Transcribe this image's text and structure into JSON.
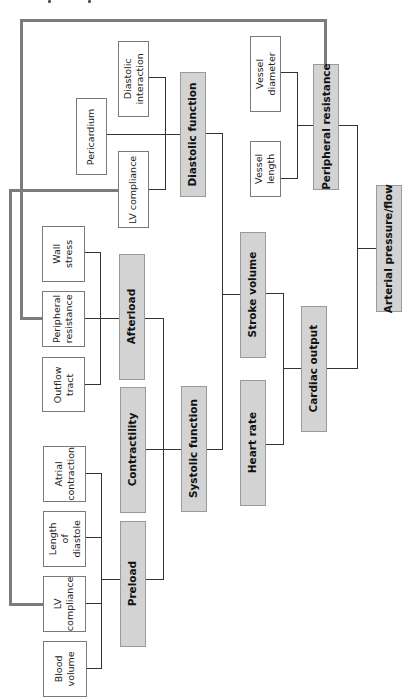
{
  "diagram": {
    "type": "hierarchical-tree",
    "orientation": "rotated-90-ccw",
    "colors": {
      "plain_box_fill": "#ffffff",
      "shaded_box_fill": "#d3d3d3",
      "connector": "#333333",
      "feedback_loop": "#7c7c7c"
    },
    "nodes": {
      "arterial_pressure_flow": "Arterial pressure/flow",
      "cardiac_output": "Cardiac output",
      "peripheral_resistance_main": "Peripheral resistance",
      "stroke_volume": "Stroke volume",
      "heart_rate": "Heart rate",
      "diastolic_function": "Diastolic function",
      "systolic_function": "Systolic function",
      "afterload": "Afterload",
      "contractility": "Contractility",
      "preload": "Preload",
      "vessel_diameter": "Vessel\ndiameter",
      "vessel_length": "Vessel\nlength",
      "diastolic_interaction": "Diastolic\ninteraction",
      "pericardium": "Pericardium",
      "lv_compliance_top": "LV compliance",
      "wall_stress": "Wall\nstress",
      "peripheral_resistance_afterload": "Peripheral\nresistance",
      "outflow_tract": "Outflow\ntract",
      "atrial_contraction": "Atrial\ncontraction",
      "length_of_diastole": "Length\nof\ndiastole",
      "lv_compliance_bottom": "LV\ncompliance",
      "blood_volume": "Blood\nvolume"
    },
    "edges": [
      [
        "cardiac_output",
        "arterial_pressure_flow"
      ],
      [
        "peripheral_resistance_main",
        "arterial_pressure_flow"
      ],
      [
        "stroke_volume",
        "cardiac_output"
      ],
      [
        "heart_rate",
        "cardiac_output"
      ],
      [
        "diastolic_function",
        "stroke_volume"
      ],
      [
        "systolic_function",
        "stroke_volume"
      ],
      [
        "contractility",
        "systolic_function"
      ],
      [
        "afterload",
        "systolic_function"
      ],
      [
        "preload",
        "systolic_function"
      ],
      [
        "vessel_diameter",
        "peripheral_resistance_main"
      ],
      [
        "vessel_length",
        "peripheral_resistance_main"
      ],
      [
        "diastolic_interaction",
        "diastolic_function"
      ],
      [
        "pericardium",
        "diastolic_function"
      ],
      [
        "lv_compliance_top",
        "diastolic_function"
      ],
      [
        "wall_stress",
        "afterload"
      ],
      [
        "peripheral_resistance_afterload",
        "afterload"
      ],
      [
        "outflow_tract",
        "afterload"
      ],
      [
        "atrial_contraction",
        "preload"
      ],
      [
        "length_of_diastole",
        "preload"
      ],
      [
        "lv_compliance_bottom",
        "preload"
      ],
      [
        "blood_volume",
        "preload"
      ]
    ],
    "feedback_links": [
      [
        "peripheral_resistance_main",
        "peripheral_resistance_afterload"
      ],
      [
        "lv_compliance_top",
        "lv_compliance_bottom"
      ]
    ]
  }
}
